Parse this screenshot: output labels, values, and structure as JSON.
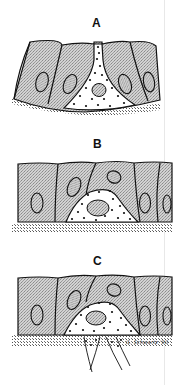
{
  "figure": {
    "panels": [
      {
        "label": "A",
        "description": "Dotted cell wedged between epithelial cells, narrow apical process reaching the surface"
      },
      {
        "label": "B",
        "description": "Dotted cell rounded at base beneath the epithelial layer"
      },
      {
        "label": "C",
        "description": "Dotted cell at base with processes extending through basement membrane"
      }
    ],
    "signature": "G. Schwartz '90",
    "colors": {
      "cell_fill": "#c8c8c8",
      "outline": "#111111",
      "background": "#ffffff",
      "dots": "#111111"
    }
  }
}
